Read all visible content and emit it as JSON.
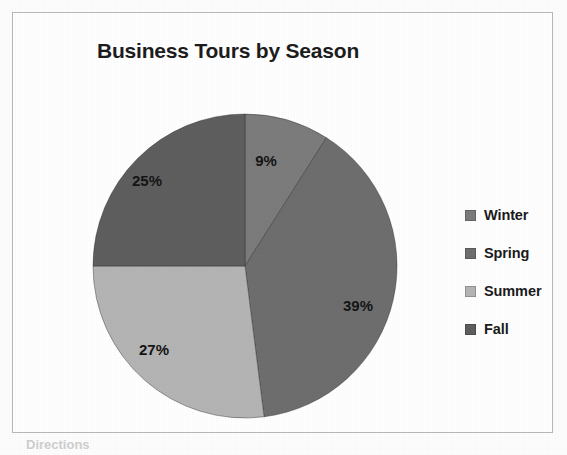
{
  "frame": {
    "border_color": "#b9b9b9",
    "background": "#ffffff"
  },
  "undertext": "Directions",
  "chart_data": {
    "type": "pie",
    "title": "Business Tours by Season",
    "xlabel": "",
    "ylabel": "",
    "legend_position": "right",
    "grid": false,
    "start_angle_deg": 0,
    "direction": "clockwise",
    "units": "percent",
    "categories": [
      "Winter",
      "Spring",
      "Summer",
      "Fall"
    ],
    "values": [
      9,
      39,
      27,
      25
    ],
    "data_labels": [
      "9%",
      "39%",
      "27%",
      "25%"
    ],
    "colors": [
      "#7c7c7c",
      "#6e6e6e",
      "#b4b4b4",
      "#5e5e5e"
    ],
    "slices": [
      {
        "name": "Winter",
        "value": 9,
        "label": "9%",
        "color": "#7c7c7c",
        "start_deg": 0,
        "end_deg": 32.4,
        "label_x": 176,
        "label_y": 51
      },
      {
        "name": "Spring",
        "value": 39,
        "label": "39%",
        "color": "#6e6e6e",
        "start_deg": 32.4,
        "end_deg": 172.8,
        "label_x": 268,
        "label_y": 196
      },
      {
        "name": "Summer",
        "value": 27,
        "label": "27%",
        "color": "#b4b4b4",
        "start_deg": 172.8,
        "end_deg": 270.0,
        "label_x": 64,
        "label_y": 240
      },
      {
        "name": "Fall",
        "value": 25,
        "label": "25%",
        "color": "#5e5e5e",
        "start_deg": 270.0,
        "end_deg": 360.0,
        "label_x": 57,
        "label_y": 71
      }
    ]
  },
  "legend": {
    "items": [
      {
        "label": "Winter",
        "color": "#7c7c7c"
      },
      {
        "label": "Spring",
        "color": "#6e6e6e"
      },
      {
        "label": "Summer",
        "color": "#b4b4b4"
      },
      {
        "label": "Fall",
        "color": "#5e5e5e"
      }
    ]
  }
}
